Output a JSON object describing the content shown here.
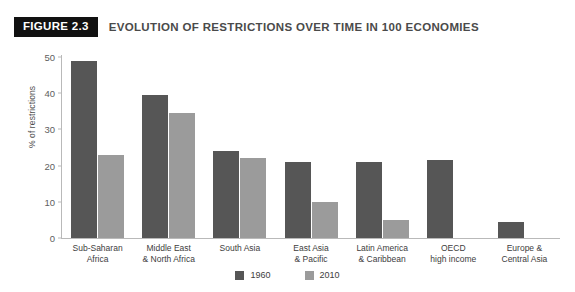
{
  "header": {
    "badge": "FIGURE 2.3",
    "title": "EVOLUTION OF RESTRICTIONS OVER TIME IN 100 ECONOMIES"
  },
  "colors": {
    "series_1960": "#565656",
    "series_2010": "#9b9b9b",
    "badge_background": "#111111",
    "axis": "#b9b9b9",
    "page_background": "#ffffff"
  },
  "legend": {
    "position": "bottom-center",
    "items": [
      {
        "label": "1960",
        "color": "#565656",
        "swatch": "square-swatch"
      },
      {
        "label": "2010",
        "color": "#9b9b9b",
        "swatch": "square-swatch"
      }
    ]
  },
  "chart_data": {
    "type": "bar",
    "title": "EVOLUTION OF RESTRICTIONS OVER TIME IN 100 ECONOMIES",
    "xlabel": "",
    "ylabel": "% of restrictions",
    "ylim": [
      0,
      50
    ],
    "yticks": [
      0,
      10,
      20,
      30,
      40,
      50
    ],
    "ytick_labels": [
      "0",
      "10",
      "20",
      "30",
      "40",
      "50"
    ],
    "grid": false,
    "categories": [
      "Sub-Saharan\nAfrica",
      "Middle East\n& North Africa",
      "South Asia",
      "East Asia\n& Pacific",
      "Latin America\n& Caribbean",
      "OECD\nhigh income",
      "Europe &\nCentral Asia"
    ],
    "category_lines": [
      [
        "Sub-Saharan",
        "Africa"
      ],
      [
        "Middle East",
        "& North Africa"
      ],
      [
        "South Asia",
        ""
      ],
      [
        "East Asia",
        "& Pacific"
      ],
      [
        "Latin America",
        "& Caribbean"
      ],
      [
        "OECD",
        "high income"
      ],
      [
        "Europe &",
        "Central Asia"
      ]
    ],
    "series": [
      {
        "name": "1960",
        "color": "#565656",
        "values": [
          49,
          39.5,
          24,
          21,
          21,
          21.5,
          4.5
        ]
      },
      {
        "name": "2010",
        "color": "#9b9b9b",
        "values": [
          23,
          34.5,
          22,
          10,
          5,
          0,
          0
        ]
      }
    ]
  }
}
